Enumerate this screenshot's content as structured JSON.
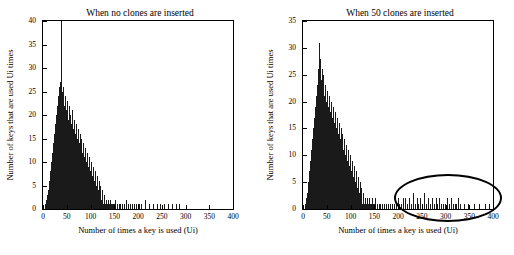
{
  "chart_data": [
    {
      "type": "bar",
      "title": "When no clones are inserted",
      "xlabel": "Number of times a key is used (Ui)",
      "ylabel": "Number of keys that are used Ui times",
      "xlim": [
        0,
        400
      ],
      "ylim": [
        0,
        40
      ],
      "xticks": [
        0,
        50,
        100,
        150,
        200,
        250,
        300,
        350,
        400
      ],
      "yticks": [
        0,
        5,
        10,
        15,
        20,
        25,
        30,
        35,
        40
      ],
      "grid": false,
      "legend": "none",
      "x": [
        5,
        7,
        9,
        11,
        13,
        15,
        17,
        19,
        21,
        23,
        25,
        27,
        29,
        31,
        33,
        35,
        37,
        39,
        41,
        43,
        45,
        47,
        49,
        51,
        53,
        55,
        57,
        59,
        61,
        63,
        65,
        67,
        69,
        71,
        73,
        75,
        77,
        79,
        81,
        83,
        85,
        87,
        89,
        91,
        93,
        95,
        97,
        99,
        101,
        103,
        105,
        107,
        109,
        111,
        113,
        115,
        117,
        119,
        121,
        123,
        125,
        127,
        129,
        131,
        133,
        135,
        137,
        139,
        141,
        143,
        145,
        147,
        149,
        151,
        155,
        159,
        163,
        167,
        171,
        175,
        179,
        183,
        187,
        191,
        195,
        199,
        203,
        207,
        215,
        223,
        231,
        239,
        247,
        255,
        263,
        271,
        279,
        287
      ],
      "values": [
        1,
        2,
        3,
        4,
        6,
        8,
        10,
        12,
        14,
        16,
        18,
        20,
        22,
        24,
        26,
        27,
        40,
        25,
        23,
        26,
        22,
        24,
        21,
        23,
        19,
        22,
        20,
        18,
        21,
        17,
        19,
        16,
        18,
        15,
        17,
        14,
        16,
        13,
        15,
        12,
        14,
        11,
        13,
        10,
        12,
        9,
        11,
        8,
        10,
        7,
        9,
        6,
        8,
        5,
        7,
        4,
        6,
        3,
        5,
        2,
        4,
        1,
        3,
        1,
        2,
        1,
        2,
        1,
        2,
        1,
        1,
        1,
        1,
        2,
        1,
        1,
        1,
        1,
        1,
        2,
        1,
        1,
        1,
        1,
        1,
        1,
        1,
        1,
        2,
        1,
        1,
        1,
        1,
        1,
        1,
        1,
        1,
        1
      ]
    },
    {
      "type": "bar",
      "title": "When 50 clones are inserted",
      "xlabel": "Number of times a key is used (Ui)",
      "ylabel": "Number of keys that are used Ui times",
      "xlim": [
        0,
        400
      ],
      "ylim": [
        0,
        35
      ],
      "xticks": [
        0,
        50,
        100,
        150,
        200,
        250,
        300,
        350,
        400
      ],
      "yticks": [
        0,
        5,
        10,
        15,
        20,
        25,
        30,
        35
      ],
      "grid": false,
      "legend": "none",
      "annotation": "ellipse highlighting clone-induced tail between Ui = 190 and Ui = 330",
      "x": [
        5,
        7,
        9,
        11,
        13,
        15,
        17,
        19,
        21,
        23,
        25,
        27,
        29,
        31,
        33,
        35,
        37,
        39,
        41,
        43,
        45,
        47,
        49,
        51,
        53,
        55,
        57,
        59,
        61,
        63,
        65,
        67,
        69,
        71,
        73,
        75,
        77,
        79,
        81,
        83,
        85,
        87,
        89,
        91,
        93,
        95,
        97,
        99,
        101,
        103,
        105,
        107,
        109,
        111,
        113,
        115,
        117,
        119,
        121,
        123,
        125,
        127,
        129,
        131,
        133,
        135,
        137,
        139,
        141,
        143,
        145,
        147,
        149,
        151,
        155,
        159,
        163,
        167,
        171,
        175,
        179,
        183,
        187,
        191,
        195,
        199,
        203,
        207,
        211,
        215,
        219,
        223,
        227,
        231,
        235,
        239,
        243,
        247,
        251,
        255,
        259,
        263,
        267,
        271,
        275,
        279,
        283,
        287,
        291,
        295,
        299,
        303,
        307,
        311,
        315,
        319,
        323,
        327,
        331,
        339,
        347,
        359,
        371,
        383,
        391
      ],
      "values": [
        1,
        2,
        3,
        5,
        7,
        9,
        11,
        13,
        15,
        17,
        19,
        21,
        23,
        26,
        31,
        28,
        24,
        26,
        22,
        25,
        21,
        23,
        20,
        22,
        19,
        21,
        18,
        20,
        17,
        19,
        16,
        18,
        15,
        17,
        14,
        16,
        13,
        15,
        12,
        14,
        11,
        13,
        10,
        12,
        9,
        11,
        8,
        10,
        7,
        9,
        6,
        8,
        5,
        7,
        4,
        6,
        3,
        5,
        2,
        4,
        1,
        3,
        1,
        2,
        1,
        2,
        1,
        2,
        1,
        1,
        2,
        1,
        1,
        2,
        1,
        1,
        1,
        1,
        1,
        1,
        1,
        1,
        1,
        1,
        1,
        2,
        1,
        1,
        2,
        2,
        1,
        2,
        1,
        3,
        1,
        2,
        1,
        2,
        1,
        3,
        1,
        2,
        1,
        2,
        1,
        2,
        1,
        2,
        1,
        1,
        1,
        2,
        1,
        2,
        1,
        1,
        1,
        2,
        1,
        1,
        1,
        1,
        1,
        1,
        1
      ]
    }
  ],
  "panels": [
    {
      "title": "When no clones are inserted",
      "xlabel": "Number of times a key is used (Ui)",
      "ylabel": "Number of keys that are used Ui times",
      "yticks": [
        "0",
        "5",
        "10",
        "15",
        "20",
        "25",
        "30",
        "35",
        "40"
      ],
      "xticks": [
        "0",
        "50",
        "100",
        "150",
        "200",
        "250",
        "300",
        "350",
        "400"
      ]
    },
    {
      "title": "When 50 clones are inserted",
      "xlabel": "Number of times a key is used (Ui)",
      "ylabel": "Number of keys that are used Ui times",
      "yticks": [
        "0",
        "5",
        "10",
        "15",
        "20",
        "25",
        "30",
        "35"
      ],
      "xticks": [
        "0",
        "50",
        "100",
        "150",
        "200",
        "250",
        "300",
        "350",
        "400"
      ]
    }
  ]
}
